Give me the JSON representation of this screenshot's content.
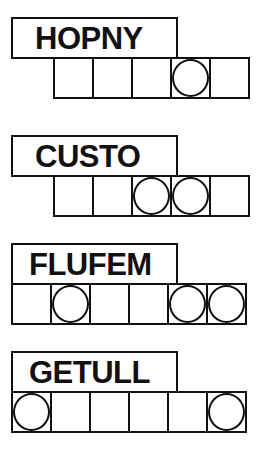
{
  "puzzles": [
    {
      "scrambled": "HOPNY",
      "letters": 5,
      "circled": [
        3
      ]
    },
    {
      "scrambled": "CUSTO",
      "letters": 5,
      "circled": [
        2,
        3
      ]
    },
    {
      "scrambled": "FLUFEM",
      "letters": 6,
      "circled": [
        1,
        4,
        5
      ]
    },
    {
      "scrambled": "GETULL",
      "letters": 6,
      "circled": [
        0,
        5
      ]
    }
  ]
}
